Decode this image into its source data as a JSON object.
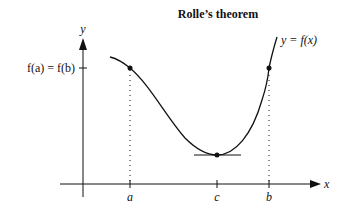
{
  "diagram": {
    "title": "Rolle’s theorem",
    "y_axis_label": "y",
    "x_axis_label": "x",
    "y_tick_label": "f(a) = f(b)",
    "curve_label": "y = f(x)",
    "x_ticks": [
      {
        "label": "a"
      },
      {
        "label": "c"
      },
      {
        "label": "b"
      }
    ],
    "points": [
      {
        "name": "point-a",
        "x": "a",
        "y": "f(a)"
      },
      {
        "name": "point-c",
        "x": "c",
        "note": "horizontal tangent at minimum"
      },
      {
        "name": "point-b",
        "x": "b",
        "y": "f(b)"
      }
    ],
    "colors": {
      "stroke": "#111111",
      "background": "#ffffff"
    }
  }
}
